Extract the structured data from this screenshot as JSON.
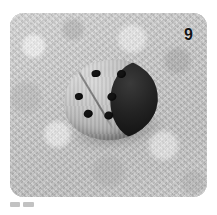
{
  "photo": {
    "number_label": "9",
    "alt_description": "Grayscale photo of a ladybug-shaped painted stone on a mottled light gray textured surface",
    "background_color": "#c6c6c6",
    "object": {
      "name": "ladybug-stone",
      "shell_color": "#c2c2c2",
      "head_color": "#121212",
      "spot_color": "#141414",
      "spot_count": 6,
      "spots": [
        {
          "left": 32,
          "top": 8,
          "w": 9,
          "h": 7
        },
        {
          "left": 57,
          "top": 12,
          "w": 9,
          "h": 8
        },
        {
          "left": 12,
          "top": 28,
          "w": 8,
          "h": 7
        },
        {
          "left": 44,
          "top": 33,
          "w": 9,
          "h": 8
        },
        {
          "left": 18,
          "top": 46,
          "w": 9,
          "h": 8
        },
        {
          "left": 38,
          "top": 51,
          "w": 9,
          "h": 8
        }
      ]
    }
  },
  "caption": {
    "chips": [
      "",
      ""
    ]
  }
}
